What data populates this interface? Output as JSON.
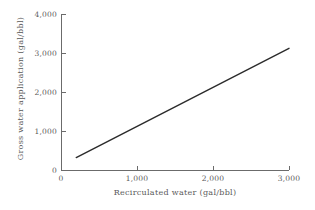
{
  "chart_data": {
    "type": "line",
    "title": "",
    "subtitle": "",
    "xlabel": "Recirculated water  (gal/bbl)",
    "ylabel": "Gross water application  (gal/bbl)",
    "xlim": [
      0,
      3000
    ],
    "ylim": [
      0,
      4000
    ],
    "xticks": [
      0,
      1000,
      2000,
      3000
    ],
    "yticks": [
      0,
      1000,
      2000,
      3000,
      4000
    ],
    "xticklabels": [
      "0",
      "1,000",
      "2,000",
      "3,000"
    ],
    "yticklabels": [
      "0",
      "1,000",
      "2,000",
      "3,000",
      "4,000"
    ],
    "grid": false,
    "legend": null,
    "annotations": [],
    "series": [
      {
        "name": "Gross water application",
        "color": "#2b2b2b",
        "linewidth": 1.4,
        "x": [
          200,
          3000
        ],
        "y": [
          320,
          3120
        ]
      }
    ],
    "line_color": "#2b2b2b",
    "background_color": "#ffffff",
    "axis_color": "#6b6b6b",
    "text_color": "#5a5a5a"
  }
}
